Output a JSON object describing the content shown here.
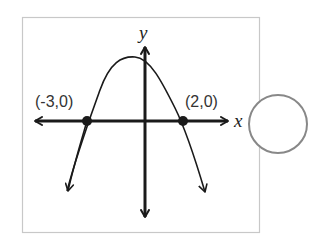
{
  "diagram": {
    "type": "parabola-graph",
    "axes": {
      "x_label": "x",
      "y_label": "y"
    },
    "points": [
      {
        "label": "(-3,0)",
        "x": -3,
        "y": 0
      },
      {
        "label": "(2,0)",
        "x": 2,
        "y": 0
      }
    ],
    "curve": {
      "shape": "downward-opening parabola",
      "x_intercepts": [
        -3,
        2
      ]
    },
    "answer_choice": {
      "shape": "radio-circle",
      "selected": false
    },
    "colors": {
      "frame": "#c8c8c8",
      "ink": "#1a1a1a",
      "radio": "#888888"
    }
  }
}
